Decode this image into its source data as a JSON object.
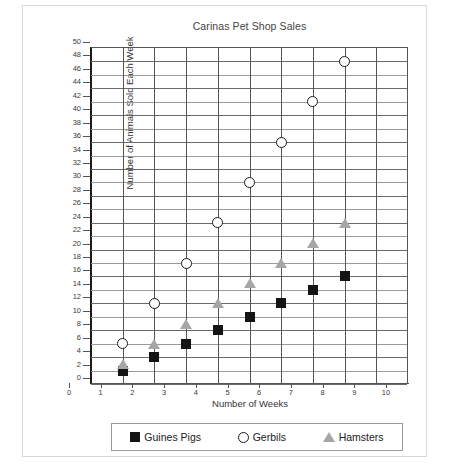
{
  "chart_data": {
    "type": "scatter",
    "title": "Carinas Pet Shop Sales",
    "xlabel": "Number of Weeks",
    "ylabel": "Number of Animals Sold Each Week",
    "xlim": [
      0,
      10
    ],
    "ylim": [
      0,
      50
    ],
    "x_ticks": [
      0,
      1,
      2,
      3,
      4,
      5,
      6,
      7,
      8,
      9,
      10
    ],
    "y_ticks": [
      0,
      2,
      4,
      6,
      8,
      10,
      12,
      14,
      16,
      18,
      20,
      22,
      24,
      26,
      28,
      30,
      32,
      34,
      36,
      38,
      40,
      42,
      44,
      46,
      48,
      50
    ],
    "grid": true,
    "legend_position": "bottom",
    "x": [
      1,
      2,
      3,
      4,
      5,
      6,
      7,
      8
    ],
    "series": [
      {
        "name": "Guines Pigs",
        "marker": "square",
        "color": "#141414",
        "values": [
          2,
          4,
          6,
          8,
          10,
          12,
          14,
          16
        ]
      },
      {
        "name": "Gerbils",
        "marker": "circle",
        "color": "#1a1a1a",
        "values": [
          6,
          12,
          18,
          24,
          30,
          36,
          42,
          48
        ]
      },
      {
        "name": "Hamsters",
        "marker": "triangle",
        "color": "#a6a6a6",
        "values": [
          3,
          6,
          9,
          12,
          15,
          18,
          21,
          24
        ]
      }
    ]
  }
}
